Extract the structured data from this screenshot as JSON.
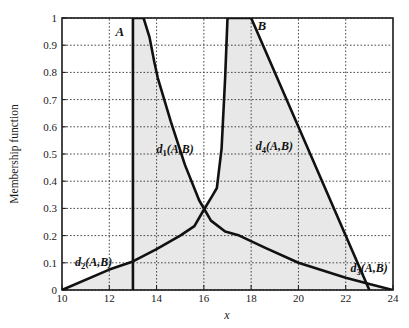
{
  "figure": {
    "background": "#ffffff",
    "plot_fill": "#e9e9e9",
    "line_color": "#1a1a1a",
    "grid_color": "#3a3a3a",
    "axis_color": "#1a1a1a"
  },
  "chart_data": {
    "type": "line",
    "title": "",
    "xlabel": "x",
    "ylabel": "Membership function",
    "xlim": [
      10,
      24
    ],
    "ylim": [
      0,
      1
    ],
    "grid": true,
    "grid_style": "dotted",
    "legend_position": "none",
    "xticks": [
      10,
      12,
      14,
      16,
      18,
      20,
      22,
      24
    ],
    "xtick_labels": [
      "10",
      "12",
      "14",
      "16",
      "18",
      "20",
      "22",
      "24"
    ],
    "yticks": [
      0,
      0.1,
      0.2,
      0.3,
      0.4,
      0.5,
      0.6,
      0.7,
      0.8,
      0.9,
      1
    ],
    "ytick_labels": [
      "0",
      "0.1",
      "0.2",
      "0.3",
      "0.4",
      "0.5",
      "0.6",
      "0.7",
      "0.8",
      "0.9",
      "1"
    ],
    "series": [
      {
        "name": "A",
        "label": "A",
        "label_xy": [
          12.45,
          0.935
        ],
        "points": [
          [
            13,
            0
          ],
          [
            13,
            1
          ],
          [
            13.45,
            1
          ],
          [
            13.7,
            0.93
          ],
          [
            13.9,
            0.84
          ],
          [
            14.05,
            0.78
          ],
          [
            14.6,
            0.62
          ],
          [
            15.2,
            0.46
          ],
          [
            15.8,
            0.33
          ],
          [
            16.3,
            0.255
          ],
          [
            16.9,
            0.215
          ],
          [
            17.5,
            0.2
          ],
          [
            18.6,
            0.155
          ],
          [
            20,
            0.1
          ],
          [
            22,
            0.045
          ],
          [
            23,
            0.022
          ],
          [
            24,
            0
          ]
        ]
      },
      {
        "name": "B",
        "label": "B",
        "label_xy": [
          18.45,
          0.955
        ],
        "points": [
          [
            10,
            0
          ],
          [
            12,
            0.075
          ],
          [
            13,
            0.105
          ],
          [
            14,
            0.15
          ],
          [
            15,
            0.2
          ],
          [
            15.6,
            0.235
          ],
          [
            16,
            0.295
          ],
          [
            16.35,
            0.345
          ],
          [
            16.55,
            0.375
          ],
          [
            16.75,
            0.52
          ],
          [
            16.9,
            0.78
          ],
          [
            17,
            1
          ],
          [
            18,
            1
          ],
          [
            23,
            0
          ]
        ]
      }
    ],
    "annotations": [
      {
        "id": "d1",
        "text": "d1(A,B)",
        "base": "d",
        "sub": "1",
        "tail": "(A,B)",
        "xy": [
          14.0,
          0.505
        ]
      },
      {
        "id": "d2",
        "text": "d2(A,B)",
        "base": "d",
        "sub": "2",
        "tail": "(A,B)",
        "xy": [
          10.55,
          0.09
        ]
      },
      {
        "id": "d3",
        "text": "d3(A,B)",
        "base": "d",
        "sub": "3",
        "tail": "(A,B)",
        "xy": [
          22.2,
          0.068
        ]
      },
      {
        "id": "d4",
        "text": "d4(A,B)",
        "base": "d",
        "sub": "4",
        "tail": "(A,B)",
        "xy": [
          18.2,
          0.515
        ]
      }
    ]
  }
}
